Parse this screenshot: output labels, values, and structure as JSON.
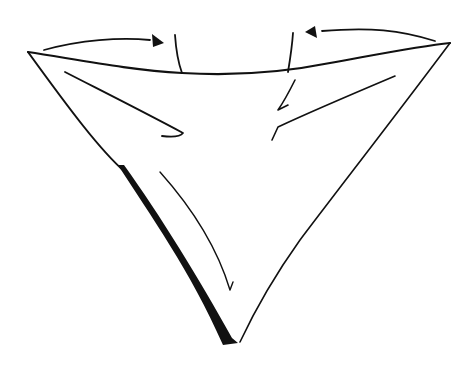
{
  "diagram": {
    "type": "fold-diagram",
    "background": "#ffffff",
    "ink": "#111111",
    "elements": {
      "triangle": "inverted triangle outline",
      "shadow": "thick shadow along lower-left edge",
      "left_arrow": "curved arrow from left corner toward center",
      "right_arrow": "curved arrow from right corner toward center",
      "crease_left": "vertical crease mark at top-left center",
      "crease_right": "vertical crease mark at top-right center",
      "fold_lines": "inner fold curves"
    }
  }
}
